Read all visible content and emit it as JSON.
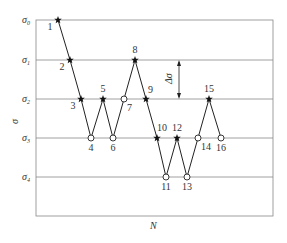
{
  "diagram": {
    "title": "",
    "xlabel": "N",
    "ylabel": "σ",
    "delta_label": "Δσ",
    "levels": [
      {
        "label": "σ",
        "sub": "0",
        "y": 20
      },
      {
        "label": "σ",
        "sub": "1",
        "y": 60
      },
      {
        "label": "σ",
        "sub": "2",
        "y": 99
      },
      {
        "label": "σ",
        "sub": "3",
        "y": 138
      },
      {
        "label": "σ",
        "sub": "4",
        "y": 177
      }
    ],
    "points": [
      {
        "n": "1",
        "x": 58,
        "level": 0,
        "marker": "star"
      },
      {
        "n": "2",
        "x": 70,
        "level": 1,
        "marker": "star"
      },
      {
        "n": "3",
        "x": 81,
        "level": 2,
        "marker": "star"
      },
      {
        "n": "4",
        "x": 91,
        "level": 3,
        "marker": "circle"
      },
      {
        "n": "5",
        "x": 103,
        "level": 2,
        "marker": "star"
      },
      {
        "n": "6",
        "x": 113,
        "level": 3,
        "marker": "circle"
      },
      {
        "n": "7",
        "x": 124,
        "level": 2,
        "marker": "circle"
      },
      {
        "n": "8",
        "x": 135,
        "level": 1,
        "marker": "star"
      },
      {
        "n": "9",
        "x": 146,
        "level": 2,
        "marker": "star"
      },
      {
        "n": "10",
        "x": 157,
        "level": 3,
        "marker": "star"
      },
      {
        "n": "11",
        "x": 166,
        "level": 4,
        "marker": "circle"
      },
      {
        "n": "12",
        "x": 177,
        "level": 3,
        "marker": "star"
      },
      {
        "n": "13",
        "x": 187,
        "level": 4,
        "marker": "circle"
      },
      {
        "n": "14",
        "x": 198,
        "level": 3,
        "marker": "circle"
      },
      {
        "n": "15",
        "x": 209,
        "level": 2,
        "marker": "star"
      },
      {
        "n": "16",
        "x": 221,
        "level": 3,
        "marker": "circle"
      }
    ],
    "legend": {
      "star": "failure",
      "circle": "run-out"
    },
    "colors": {
      "line": "#222222",
      "grid": "#888888",
      "text": "#333333"
    }
  }
}
